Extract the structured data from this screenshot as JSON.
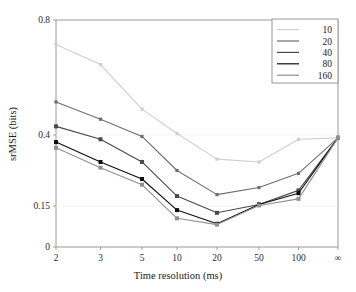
{
  "chart_data": {
    "type": "line",
    "title": "",
    "xlabel": "Time resolution (ms)",
    "ylabel": "srMSE (bits)",
    "categories": [
      "2",
      "3",
      "5",
      "10",
      "20",
      "50",
      "100",
      "∞"
    ],
    "x_tick_labels": [
      "2",
      "3",
      "5",
      "10",
      "20",
      "50",
      "100",
      "∞"
    ],
    "y_tick_labels": [
      "0",
      "0.15",
      "0.4",
      "0.8"
    ],
    "y_tick_values": [
      0,
      0.15,
      0.4,
      0.8
    ],
    "ylim": [
      0,
      0.8
    ],
    "grid": false,
    "legend_position": "top-right",
    "legend_title": "",
    "series": [
      {
        "name": "10",
        "color": "#cfcfcf",
        "values": [
          0.715,
          0.645,
          0.49,
          0.405,
          0.315,
          0.305,
          0.385,
          0.39
        ]
      },
      {
        "name": "20",
        "color": "#6e6e6e",
        "values": [
          0.515,
          0.455,
          0.395,
          0.275,
          0.19,
          0.215,
          0.265,
          0.39
        ]
      },
      {
        "name": "40",
        "color": "#4a4a4a",
        "values": [
          0.43,
          0.385,
          0.305,
          0.185,
          0.125,
          0.155,
          0.205,
          0.39
        ]
      },
      {
        "name": "80",
        "color": "#0d0d0d",
        "values": [
          0.375,
          0.305,
          0.245,
          0.135,
          0.085,
          0.155,
          0.195,
          0.39
        ]
      },
      {
        "name": "160",
        "color": "#909090",
        "values": [
          0.355,
          0.285,
          0.225,
          0.105,
          0.082,
          0.152,
          0.175,
          0.39
        ]
      }
    ]
  },
  "legend": {
    "entries": [
      {
        "label": "10",
        "color": "#cfcfcf"
      },
      {
        "label": "20",
        "color": "#6e6e6e"
      },
      {
        "label": "40",
        "color": "#4a4a4a"
      },
      {
        "label": "80",
        "color": "#0d0d0d"
      },
      {
        "label": "160",
        "color": "#909090"
      }
    ]
  }
}
